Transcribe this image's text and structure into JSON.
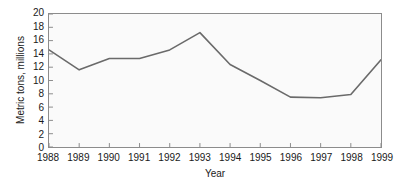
{
  "chart_data": {
    "type": "line",
    "title": "",
    "xlabel": "Year",
    "ylabel": "Metric tons, millions",
    "categories": [
      "1988",
      "1989",
      "1990",
      "1991",
      "1992",
      "1993",
      "1994",
      "1995",
      "1996",
      "1997",
      "1998",
      "1999"
    ],
    "x": [
      1988,
      1989,
      1990,
      1991,
      1992,
      1993,
      1994,
      1995,
      1996,
      1997,
      1998,
      1999
    ],
    "values": [
      14.6,
      11.6,
      13.3,
      13.3,
      14.6,
      17.2,
      12.4,
      10.0,
      7.5,
      7.4,
      7.9,
      13.1
    ],
    "series": [
      {
        "name": "Metric tons, millions",
        "values": [
          14.6,
          11.6,
          13.3,
          13.3,
          14.6,
          17.2,
          12.4,
          10.0,
          7.5,
          7.4,
          7.9,
          13.1
        ]
      }
    ],
    "ylim": [
      0,
      20
    ],
    "yticks": [
      0,
      2,
      4,
      6,
      8,
      10,
      12,
      14,
      16,
      18,
      20
    ],
    "ytick_labels": [
      "0",
      "2",
      "4",
      "6",
      "8",
      "10",
      "12",
      "14",
      "16",
      "18",
      "20"
    ],
    "xlim": [
      1988,
      1999
    ],
    "grid": false,
    "legend": false,
    "legend_position": "none",
    "line_color": "#6a6a6a",
    "plot_background": "#fafafa",
    "frame_color": "#8c8c8c"
  }
}
